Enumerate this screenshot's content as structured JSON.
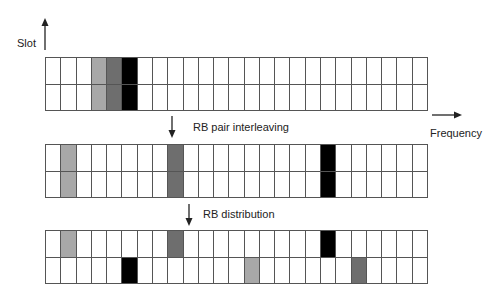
{
  "axes": {
    "slot_label": "Slot",
    "frequency_label": "Frequency"
  },
  "steps": {
    "step1_label": "RB pair interleaving",
    "step2_label": "RB distribution"
  },
  "colors": {
    "light": "#a8a8a8",
    "dark": "#6e6e6e",
    "black": "#000000"
  },
  "grid": {
    "columns": 25,
    "rows": 2
  },
  "grids": [
    {
      "name": "original",
      "top": 57,
      "filled": [
        {
          "row": 0,
          "col": 3,
          "shade": "light"
        },
        {
          "row": 1,
          "col": 3,
          "shade": "light"
        },
        {
          "row": 0,
          "col": 4,
          "shade": "dark"
        },
        {
          "row": 1,
          "col": 4,
          "shade": "dark"
        },
        {
          "row": 0,
          "col": 5,
          "shade": "black"
        },
        {
          "row": 1,
          "col": 5,
          "shade": "black"
        }
      ]
    },
    {
      "name": "interleaved",
      "top": 144,
      "filled": [
        {
          "row": 0,
          "col": 1,
          "shade": "light"
        },
        {
          "row": 1,
          "col": 1,
          "shade": "light"
        },
        {
          "row": 0,
          "col": 8,
          "shade": "dark"
        },
        {
          "row": 1,
          "col": 8,
          "shade": "dark"
        },
        {
          "row": 0,
          "col": 18,
          "shade": "black"
        },
        {
          "row": 1,
          "col": 18,
          "shade": "black"
        }
      ]
    },
    {
      "name": "distributed",
      "top": 230,
      "filled": [
        {
          "row": 0,
          "col": 1,
          "shade": "light"
        },
        {
          "row": 0,
          "col": 8,
          "shade": "dark"
        },
        {
          "row": 0,
          "col": 18,
          "shade": "black"
        },
        {
          "row": 1,
          "col": 5,
          "shade": "black"
        },
        {
          "row": 1,
          "col": 13,
          "shade": "light"
        },
        {
          "row": 1,
          "col": 20,
          "shade": "dark"
        }
      ]
    }
  ]
}
